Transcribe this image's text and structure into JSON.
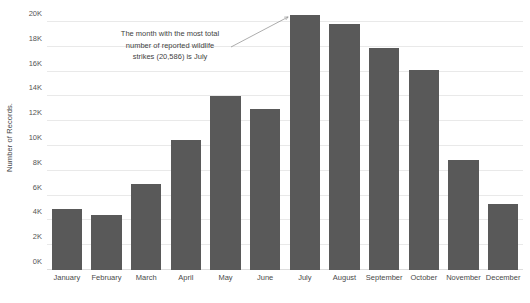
{
  "chart_data": {
    "type": "bar",
    "title": "",
    "subtitle": "",
    "xlabel": "",
    "ylabel": "Number of Records.",
    "categories": [
      "January",
      "February",
      "March",
      "April",
      "May",
      "June",
      "July",
      "August",
      "September",
      "October",
      "November",
      "December"
    ],
    "values": [
      4950,
      4450,
      6950,
      10500,
      14000,
      12950,
      20586,
      19800,
      17900,
      16150,
      8900,
      5350
    ],
    "ylim": [
      0,
      20000
    ],
    "yticks": [
      0,
      2000,
      4000,
      6000,
      8000,
      10000,
      12000,
      14000,
      16000,
      18000,
      20000
    ],
    "ytick_labels": [
      "0K",
      "2K",
      "4K",
      "6K",
      "8K",
      "10K",
      "12K",
      "14K",
      "16K",
      "18K",
      "20K"
    ],
    "grid": true,
    "legend": false,
    "bar_color": "#595959",
    "gridline_color": "#e9e9e9",
    "background_color": "#ffffff",
    "annotations": [
      {
        "text": "The month with the most total number of reported wildlife strikes (20,586) is July",
        "lines": [
          "The month with the most total",
          "number of reported wildlife",
          "strikes (20,586) is July"
        ],
        "points_to_category": "July",
        "points_to_value": 20586
      }
    ]
  },
  "axis": {
    "y_title": "Number of Records."
  }
}
